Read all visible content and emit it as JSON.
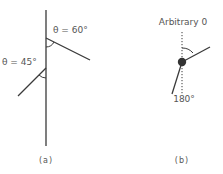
{
  "panel_a": {
    "caption": "(a)",
    "upper_angle_label": "θ = 60°",
    "lower_angle_label": "θ = 45°"
  },
  "panel_b": {
    "caption": "(b)",
    "top_label": "Arbitrary 0",
    "bottom_label": "180°"
  },
  "colors": {
    "line": "#3a3a3a",
    "text": "#555555"
  }
}
